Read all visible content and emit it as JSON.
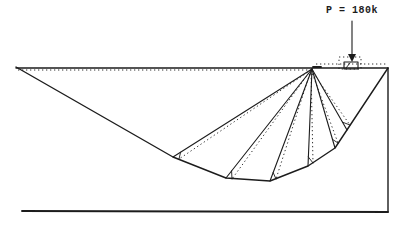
{
  "figure": {
    "type": "slope-stability-failure-mechanism-diagram",
    "load_label": "P = 180k",
    "ink_color": "#1c1c1c",
    "paper_color": "#ffffff",
    "canvas": {
      "width": 399,
      "height": 226
    },
    "label_pos": {
      "left": 326,
      "top": 5
    },
    "ground": {
      "solid": [
        [
          16,
          68
        ],
        [
          388,
          68
        ]
      ],
      "dotted_left": [
        [
          18,
          70
        ],
        [
          310,
          70
        ]
      ],
      "dotted_right": [
        [
          316,
          64
        ],
        [
          386,
          64
        ]
      ]
    },
    "borders": {
      "right": [
        [
          388,
          68
        ],
        [
          388,
          212
        ]
      ],
      "bottom": [
        [
          22,
          211
        ],
        [
          388,
          212
        ]
      ]
    },
    "slip_surface": [
      [
        16,
        67
      ],
      [
        173,
        157
      ],
      [
        226,
        178
      ],
      [
        270,
        181
      ],
      [
        308,
        166
      ],
      [
        335,
        148
      ],
      [
        388,
        68
      ]
    ],
    "apex": [
      312,
      69
    ],
    "apex_tick": [
      [
        313,
        67
      ],
      [
        321,
        67
      ]
    ],
    "ray_endpoints": [
      [
        173,
        157
      ],
      [
        226,
        178
      ],
      [
        270,
        181
      ],
      [
        308,
        166
      ],
      [
        335,
        148
      ],
      [
        347,
        130
      ]
    ],
    "dotted_apex": [
      311,
      70
    ],
    "dotted_endpoints": [
      [
        179,
        159
      ],
      [
        232,
        179
      ],
      [
        276,
        179
      ],
      [
        313,
        163
      ],
      [
        338,
        143
      ],
      [
        350,
        125
      ]
    ],
    "base_tick_length": 9,
    "footing": {
      "solid_rect": [
        344,
        62,
        14,
        7
      ],
      "dotted_rect": [
        339,
        57,
        22,
        12
      ],
      "hatch": [
        [
          350,
          63
        ],
        [
          346,
          68
        ]
      ]
    },
    "arrow": {
      "line": [
        [
          352,
          21
        ],
        [
          352,
          56
        ]
      ],
      "head": [
        [
          348,
          54
        ],
        [
          356,
          54
        ],
        [
          352,
          62
        ]
      ]
    }
  }
}
